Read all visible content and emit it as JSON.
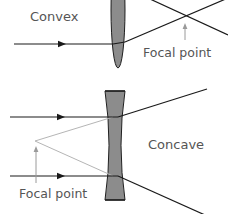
{
  "diagram": {
    "colors": {
      "lens_fill": "#8c8c8c",
      "lens_stroke": "#1f1f1f",
      "ray": "#1a1a1a",
      "virtual_ray": "#b5b5b5",
      "pointer": "#9a9a9a",
      "text": "#555555"
    },
    "convex": {
      "label": "Convex",
      "focal_label": "Focal point"
    },
    "concave": {
      "label": "Concave",
      "focal_label": "Focal point"
    }
  }
}
